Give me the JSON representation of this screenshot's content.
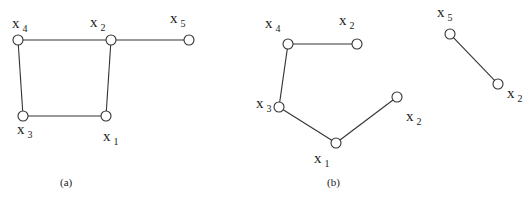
{
  "figure": {
    "panels": [
      {
        "id": "a",
        "caption": "(a)",
        "caption_pos": [
          60,
          186
        ],
        "nodes": [
          {
            "id": "a-x4",
            "label": "x",
            "sub": "4",
            "pos": [
              18,
              40
            ],
            "label_pos": [
              12,
              28
            ]
          },
          {
            "id": "a-x2",
            "label": "x",
            "sub": "2",
            "pos": [
              111,
              40
            ],
            "label_pos": [
              90,
              27
            ]
          },
          {
            "id": "a-x5",
            "label": "x",
            "sub": "5",
            "pos": [
              189,
              40
            ],
            "label_pos": [
              170,
              23
            ]
          },
          {
            "id": "a-x3",
            "label": "x",
            "sub": "3",
            "pos": [
              23,
              116
            ],
            "label_pos": [
              17,
              134
            ]
          },
          {
            "id": "a-x1",
            "label": "x",
            "sub": "1",
            "pos": [
              106,
              116
            ],
            "label_pos": [
              103,
              141
            ]
          }
        ],
        "edges": [
          [
            "a-x4",
            "a-x2"
          ],
          [
            "a-x2",
            "a-x5"
          ],
          [
            "a-x4",
            "a-x3"
          ],
          [
            "a-x3",
            "a-x1"
          ],
          [
            "a-x1",
            "a-x2"
          ]
        ]
      },
      {
        "id": "b",
        "caption": "(b)",
        "caption_pos": [
          327,
          186
        ],
        "nodes": [
          {
            "id": "b-x4",
            "label": "x",
            "sub": "4",
            "pos": [
              288,
              44
            ],
            "label_pos": [
              265,
              28
            ]
          },
          {
            "id": "b-x2a",
            "label": "x",
            "sub": "2",
            "pos": [
              357,
              44
            ],
            "label_pos": [
              339,
              25
            ]
          },
          {
            "id": "b-x3",
            "label": "x",
            "sub": "3",
            "pos": [
              279,
              107
            ],
            "label_pos": [
              256,
              108
            ]
          },
          {
            "id": "b-x1",
            "label": "x",
            "sub": "1",
            "pos": [
              336,
              143
            ],
            "label_pos": [
              314,
              163
            ]
          },
          {
            "id": "b-x2b",
            "label": "x",
            "sub": "2",
            "pos": [
              397,
              97
            ],
            "label_pos": [
              406,
              121
            ]
          },
          {
            "id": "b-x5",
            "label": "x",
            "sub": "5",
            "pos": [
              450,
              34
            ],
            "label_pos": [
              437,
              17
            ]
          },
          {
            "id": "b-x2c",
            "label": "x",
            "sub": "2",
            "pos": [
              498,
              84
            ],
            "label_pos": [
              507,
              98
            ]
          }
        ],
        "edges": [
          [
            "b-x4",
            "b-x2a"
          ],
          [
            "b-x4",
            "b-x3"
          ],
          [
            "b-x3",
            "b-x1"
          ],
          [
            "b-x1",
            "b-x2b"
          ],
          [
            "b-x5",
            "b-x2c"
          ]
        ]
      }
    ],
    "colors": {
      "stroke": "#333333",
      "node_fill": "#ffffff",
      "text": "#222222",
      "background": "#ffffff"
    },
    "node_radius": 5
  }
}
